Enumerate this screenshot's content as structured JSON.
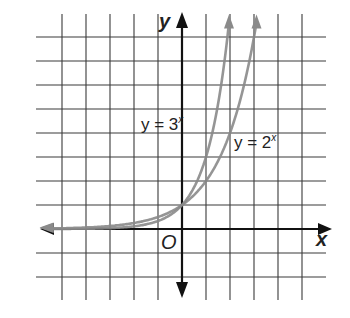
{
  "chart_data": {
    "type": "line",
    "title": "",
    "xlabel": "x",
    "ylabel": "y",
    "origin_label": "O",
    "xlim": [
      -6,
      6
    ],
    "ylim": [
      -3,
      8
    ],
    "grid": true,
    "unit_px": 24,
    "series": [
      {
        "name": "y = 3^x",
        "label_base": "y = 3",
        "label_exp": "x",
        "color": "#8a8a8a",
        "x": [
          -6,
          -5,
          -4,
          -3,
          -2,
          -1,
          0,
          1,
          1.5,
          1.89
        ],
        "y": [
          0.0014,
          0.0041,
          0.0123,
          0.037,
          0.111,
          0.333,
          1,
          3,
          5.196,
          8
        ]
      },
      {
        "name": "y = 2^x",
        "label_base": "y = 2",
        "label_exp": "x",
        "color": "#8a8a8a",
        "x": [
          -6,
          -5,
          -4,
          -3,
          -2,
          -1,
          0,
          1,
          2,
          2.5,
          3
        ],
        "y": [
          0.0156,
          0.031,
          0.0625,
          0.125,
          0.25,
          0.5,
          1,
          2,
          4,
          5.657,
          8
        ]
      }
    ],
    "legend": "inline labels",
    "annotations": [
      "y = 3^x",
      "y = 2^x",
      "O"
    ]
  },
  "labels": {
    "x_axis": "x",
    "y_axis": "y",
    "origin": "O",
    "curve_3x_base": "y = 3",
    "curve_3x_exp": "x",
    "curve_2x_base": "y = 2",
    "curve_2x_exp": "x"
  },
  "colors": {
    "grid": "#3a3a3a",
    "axes": "#111111",
    "curves": "#8a8a8a"
  }
}
